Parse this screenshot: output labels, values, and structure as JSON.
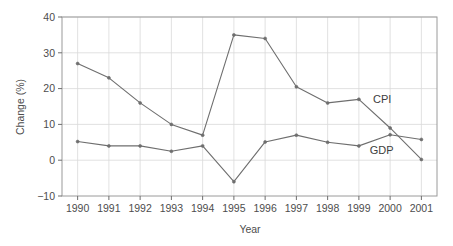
{
  "chart_data": {
    "type": "line",
    "title": "",
    "xlabel": "Year",
    "ylabel": "Change (%)",
    "categories": [
      "1990",
      "1991",
      "1992",
      "1993",
      "1994",
      "1995",
      "1996",
      "1997",
      "1998",
      "1999",
      "2000",
      "2001"
    ],
    "x": [
      1990,
      1991,
      1992,
      1993,
      1994,
      1995,
      1996,
      1997,
      1998,
      1999,
      2000,
      2001
    ],
    "xlim": [
      1989.5,
      2001.5
    ],
    "ylim": [
      -10,
      40
    ],
    "yticks": [
      -10,
      0,
      10,
      20,
      30,
      40
    ],
    "ytick_labels": [
      "−10",
      "0",
      "10",
      "20",
      "30",
      "40"
    ],
    "grid": true,
    "grid_color": "#d9d9d9",
    "legend_position": "inline-annotations",
    "series": [
      {
        "name": "CPI",
        "color": "#6e6e6e",
        "marker": "dot",
        "values": [
          27,
          23,
          16,
          10,
          7,
          35,
          34,
          20.5,
          16,
          17,
          9,
          0.2
        ]
      },
      {
        "name": "GDP",
        "color": "#6e6e6e",
        "marker": "dot",
        "values": [
          5.2,
          4,
          4,
          2.5,
          4,
          -6,
          5.1,
          7,
          5,
          4,
          7.1,
          5.8
        ]
      }
    ],
    "annotations": [
      {
        "text": "CPI",
        "x": 1999.45,
        "y": 16.0
      },
      {
        "text": "GDP",
        "x": 1999.35,
        "y": 1.8
      }
    ]
  },
  "axis": {
    "y_title": "Change (%)",
    "x_title": "Year"
  }
}
